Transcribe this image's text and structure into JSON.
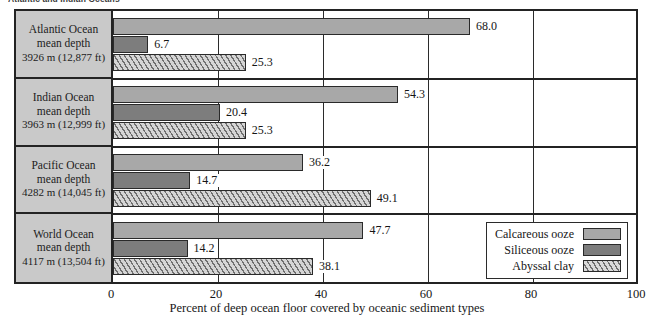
{
  "figure": {
    "top_caption": "Atlantic and Indian Oceans",
    "axis_title": "Percent of deep ocean floor covered by oceanic sediment types"
  },
  "chart_data": {
    "type": "bar",
    "orientation": "horizontal",
    "title": "",
    "xlabel": "Percent of deep ocean floor covered by oceanic sediment types",
    "ylabel": "",
    "xlim": [
      0,
      100
    ],
    "xticks": [
      0,
      20,
      40,
      60,
      80,
      100
    ],
    "grid": true,
    "legend_position": "bottom-right",
    "categories": [
      "Atlantic Ocean mean depth 3926 m (12,877 ft)",
      "Indian Ocean mean depth 3963 m (12,999 ft)",
      "Pacific Ocean mean depth 4282 m (14,045 ft)",
      "World Ocean mean depth 4117 m (13,504 ft)"
    ],
    "series": [
      {
        "name": "Calcareous ooze",
        "values": [
          68.0,
          54.3,
          36.2,
          47.7
        ]
      },
      {
        "name": "Siliceous ooze",
        "values": [
          6.7,
          20.4,
          14.7,
          14.2
        ]
      },
      {
        "name": "Abyssal clay",
        "values": [
          25.3,
          25.3,
          49.1,
          38.1
        ]
      }
    ]
  },
  "rows": [
    {
      "name": "Atlantic Ocean",
      "line1": "Atlantic Ocean",
      "line2": "mean depth",
      "line3": "3926 m (12,877 ft)",
      "bars": [
        {
          "key": "calc",
          "value": 68.0,
          "label": "68.0"
        },
        {
          "key": "sili",
          "value": 6.7,
          "label": "6.7"
        },
        {
          "key": "abys",
          "value": 25.3,
          "label": "25.3"
        }
      ]
    },
    {
      "name": "Indian Ocean",
      "line1": "Indian Ocean",
      "line2": "mean depth",
      "line3": "3963 m (12,999 ft)",
      "bars": [
        {
          "key": "calc",
          "value": 54.3,
          "label": "54.3"
        },
        {
          "key": "sili",
          "value": 20.4,
          "label": "20.4"
        },
        {
          "key": "abys",
          "value": 25.3,
          "label": "25.3"
        }
      ]
    },
    {
      "name": "Pacific Ocean",
      "line1": "Pacific Ocean",
      "line2": "mean depth",
      "line3": "4282 m (14,045 ft)",
      "bars": [
        {
          "key": "calc",
          "value": 36.2,
          "label": "36.2"
        },
        {
          "key": "sili",
          "value": 14.7,
          "label": "14.7"
        },
        {
          "key": "abys",
          "value": 49.1,
          "label": "49.1"
        }
      ]
    },
    {
      "name": "World Ocean",
      "line1": "World Ocean",
      "line2": "mean depth",
      "line3": "4117 m (13,504 ft)",
      "bars": [
        {
          "key": "calc",
          "value": 47.7,
          "label": "47.7"
        },
        {
          "key": "sili",
          "value": 14.2,
          "label": "14.2"
        },
        {
          "key": "abys",
          "value": 38.1,
          "label": "38.1"
        }
      ]
    }
  ],
  "legend": {
    "items": [
      {
        "key": "calc",
        "label": "Calcareous ooze"
      },
      {
        "key": "sili",
        "label": "Siliceous ooze"
      },
      {
        "key": "abys",
        "label": "Abyssal clay"
      }
    ]
  },
  "xaxis": {
    "ticks": [
      "0",
      "20",
      "40",
      "60",
      "80",
      "100"
    ]
  },
  "colors": {
    "calcareous": "#a8a8a8",
    "siliceous": "#7d7d7d",
    "abyssal_light": "#d5d5d5",
    "abyssal_dark": "#6f6f6f",
    "frame": "#232323",
    "label_box": "#c9c9c9"
  }
}
